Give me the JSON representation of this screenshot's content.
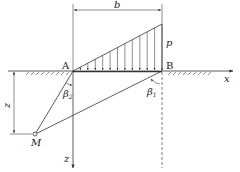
{
  "diagram": {
    "title": "",
    "labels": {
      "width": "b",
      "load": "p",
      "point_a": "A",
      "point_b": "B",
      "x_axis": "x",
      "z_axis": "z",
      "depth": "z",
      "point_m": "M",
      "angle_2": "β",
      "angle_2_sub": "2",
      "angle_1": "β",
      "angle_1_sub": "1"
    },
    "geometry": {
      "A": [
        73,
        71
      ],
      "B": [
        162,
        71
      ],
      "load_top": [
        162,
        24
      ],
      "M": [
        35,
        134
      ],
      "ground_y": 71,
      "dimension_y": 10
    },
    "load_type": "triangular distributed load",
    "load_arrow_count": 11,
    "colors": {
      "line": "#333333",
      "background": "#ffffff"
    }
  }
}
